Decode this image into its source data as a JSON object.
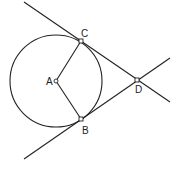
{
  "diagram": {
    "points": [
      {
        "id": "A",
        "label": "A",
        "role": "circle center"
      },
      {
        "id": "B",
        "label": "B",
        "role": "tangent point"
      },
      {
        "id": "C",
        "label": "C",
        "role": "tangent point"
      },
      {
        "id": "D",
        "label": "D",
        "role": "external intersection of tangents"
      }
    ],
    "segments": [
      {
        "from": "A",
        "to": "C",
        "kind": "radius"
      },
      {
        "from": "A",
        "to": "B",
        "kind": "radius"
      }
    ],
    "lines": [
      {
        "through": [
          "C",
          "D"
        ],
        "kind": "tangent"
      },
      {
        "through": [
          "B",
          "D"
        ],
        "kind": "tangent"
      }
    ],
    "circle": {
      "center": "A",
      "through": [
        "B",
        "C"
      ]
    }
  }
}
